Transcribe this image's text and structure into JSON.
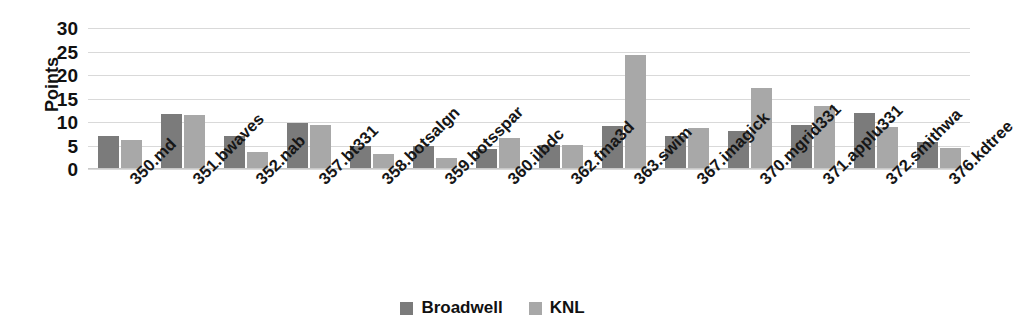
{
  "chart_data": {
    "type": "bar",
    "title": "",
    "subtitle": "",
    "xlabel": "",
    "ylabel": "Points",
    "ylim": [
      0,
      30
    ],
    "ytick_step": 5,
    "yticks": [
      30,
      25,
      20,
      15,
      10,
      5,
      0
    ],
    "grid": true,
    "legend_position": "bottom-center",
    "categories": [
      "350.md",
      "351.bwaves",
      "352.nab",
      "357.bt331",
      "358.botsalgn",
      "359.botsspar",
      "360.ilbdc",
      "362.fma3d",
      "363.swim",
      "367.imagick",
      "370.mgrid331",
      "371.applu331",
      "372.smithwa",
      "376.kdtree"
    ],
    "series": [
      {
        "name": "Broadwell",
        "color": "#7b7b7b",
        "values": [
          7,
          11.7,
          7,
          9.8,
          5,
          5,
          4.3,
          5.2,
          9.2,
          7,
          8,
          9.4,
          12,
          5.7
        ]
      },
      {
        "name": "KNL",
        "color": "#a8a8a8",
        "values": [
          6.1,
          11.5,
          3.6,
          9.4,
          3.3,
          2.3,
          6.5,
          5.2,
          24.2,
          8.7,
          17.3,
          13.4,
          8.9,
          4.4
        ]
      }
    ]
  },
  "axis": {
    "y_title": "Points"
  },
  "legend": {
    "items": [
      {
        "label": "Broadwell",
        "color": "#7b7b7b",
        "swatch_name": "legend-swatch-broadwell"
      },
      {
        "label": "KNL",
        "color": "#a8a8a8",
        "swatch_name": "legend-swatch-knl"
      }
    ]
  }
}
